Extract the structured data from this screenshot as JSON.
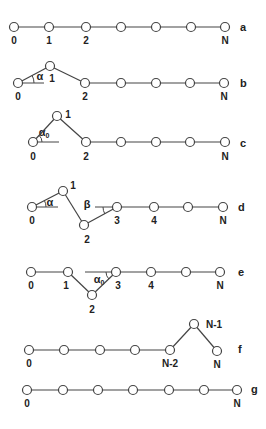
{
  "diagram": {
    "colors": {
      "line": "#444444",
      "node_fill": "#ffffff",
      "node_stroke": "#444444",
      "text": "#222222"
    },
    "node_radius": 4.5,
    "rows": [
      {
        "id": "a",
        "label": "a",
        "label_pos": [
          240,
          31
        ],
        "nodes": [
          [
            14,
            27
          ],
          [
            49,
            27
          ],
          [
            86,
            27
          ],
          [
            121,
            27
          ],
          [
            156,
            27
          ],
          [
            191,
            27
          ],
          [
            225,
            27
          ]
        ],
        "node_labels": [
          {
            "text": "0",
            "pos": [
              14,
              44
            ]
          },
          {
            "text": "1",
            "pos": [
              49,
              44
            ]
          },
          {
            "text": "2",
            "pos": [
              86,
              44
            ]
          },
          {
            "text": "N",
            "pos": [
              225,
              44
            ]
          }
        ],
        "angles": []
      },
      {
        "id": "b",
        "label": "b",
        "label_pos": [
          240,
          87
        ],
        "nodes": [
          [
            18,
            83
          ],
          [
            50,
            66
          ],
          [
            85,
            83
          ],
          [
            121,
            83
          ],
          [
            156,
            83
          ],
          [
            190,
            83
          ],
          [
            224,
            83
          ]
        ],
        "node_labels": [
          {
            "text": "0",
            "pos": [
              18,
              100
            ]
          },
          {
            "text": "1",
            "pos": [
              52,
              82
            ]
          },
          {
            "text": "2",
            "pos": [
              85,
              100
            ]
          },
          {
            "text": "N",
            "pos": [
              224,
              100
            ]
          }
        ],
        "angles": [
          {
            "symbol": "α",
            "pos": [
              40,
              80
            ],
            "arc": {
              "cx": 18,
              "cy": 83,
              "r": 16,
              "from": 0,
              "to": -28
            },
            "ref_line": [
              [
                18,
                83
              ],
              [
                44,
                83
              ]
            ]
          }
        ]
      },
      {
        "id": "c",
        "label": "c",
        "label_pos": [
          240,
          147
        ],
        "nodes": [
          [
            33,
            142
          ],
          [
            57,
            116
          ],
          [
            86,
            142
          ],
          [
            121,
            142
          ],
          [
            156,
            142
          ],
          [
            190,
            142
          ],
          [
            225,
            142
          ]
        ],
        "node_labels": [
          {
            "text": "0",
            "pos": [
              33,
              160
            ]
          },
          {
            "text": "1",
            "pos": [
              68,
              118
            ]
          },
          {
            "text": "2",
            "pos": [
              86,
              160
            ]
          },
          {
            "text": "N",
            "pos": [
              225,
              160
            ]
          }
        ],
        "angles": [
          {
            "symbol": "α",
            "sub": "0",
            "pos": [
              44,
              136
            ],
            "arc": {
              "cx": 33,
              "cy": 142,
              "r": 9,
              "from": 0,
              "to": -47
            },
            "ref_line": [
              [
                33,
                142
              ],
              [
                59,
                142
              ]
            ]
          }
        ]
      },
      {
        "id": "d",
        "label": "d",
        "label_pos": [
          238,
          211
        ],
        "nodes": [
          [
            32,
            207
          ],
          [
            63,
            191
          ],
          [
            84,
            225
          ],
          [
            117,
            207
          ],
          [
            154,
            207
          ],
          [
            188,
            207
          ],
          [
            223,
            207
          ]
        ],
        "node_labels": [
          {
            "text": "0",
            "pos": [
              32,
              224
            ]
          },
          {
            "text": "1",
            "pos": [
              73,
              189
            ]
          },
          {
            "text": "2",
            "pos": [
              87,
              243
            ]
          },
          {
            "text": "3",
            "pos": [
              117,
              224
            ]
          },
          {
            "text": "4",
            "pos": [
              154,
              224
            ]
          },
          {
            "text": "N",
            "pos": [
              223,
              224
            ]
          }
        ],
        "angles": [
          {
            "symbol": "α",
            "pos": [
              50,
              206
            ],
            "arc": {
              "cx": 32,
              "cy": 207,
              "r": 14,
              "from": 0,
              "to": -27
            },
            "ref_line": [
              [
                32,
                207
              ],
              [
                58,
                207
              ]
            ]
          },
          {
            "symbol": "β",
            "pos": [
              87,
              208
            ],
            "arc": {
              "cx": 117,
              "cy": 207,
              "r": 14,
              "from": 180,
              "to": 150
            },
            "ref_line": [
              [
                95,
                207
              ],
              [
                117,
                207
              ]
            ]
          }
        ]
      },
      {
        "id": "e",
        "label": "e",
        "label_pos": [
          238,
          276
        ],
        "nodes": [
          [
            31,
            272
          ],
          [
            68,
            272
          ],
          [
            92,
            295
          ],
          [
            116,
            272
          ],
          [
            151,
            272
          ],
          [
            186,
            272
          ],
          [
            220,
            272
          ]
        ],
        "node_labels": [
          {
            "text": "0",
            "pos": [
              31,
              289
            ]
          },
          {
            "text": "1",
            "pos": [
              66,
              289
            ]
          },
          {
            "text": "2",
            "pos": [
              92,
              313
            ]
          },
          {
            "text": "3",
            "pos": [
              118,
              289
            ]
          },
          {
            "text": "4",
            "pos": [
              151,
              289
            ]
          },
          {
            "text": "N",
            "pos": [
              220,
              289
            ]
          }
        ],
        "angles": [
          {
            "symbol": "α",
            "sub": "0",
            "pos": [
              99,
              283
            ],
            "arc": {
              "cx": 116,
              "cy": 272,
              "r": 10,
              "from": 180,
              "to": 136
            },
            "ref_line": [
              [
                85,
                272
              ],
              [
                116,
                272
              ]
            ]
          }
        ]
      },
      {
        "id": "f",
        "label": "f",
        "label_pos": [
          238,
          353
        ],
        "nodes": [
          [
            29,
            350
          ],
          [
            64,
            350
          ],
          [
            100,
            350
          ],
          [
            135,
            350
          ],
          [
            170,
            350
          ],
          [
            194,
            324
          ],
          [
            217,
            351
          ]
        ],
        "node_labels": [
          {
            "text": "0",
            "pos": [
              29,
              367
            ]
          },
          {
            "text": "N-2",
            "pos": [
              170,
              367
            ]
          },
          {
            "text": "N-1",
            "pos": [
              214,
              328
            ]
          },
          {
            "text": "N",
            "pos": [
              217,
              368
            ]
          }
        ],
        "angles": []
      },
      {
        "id": "g",
        "label": "g",
        "label_pos": [
          251,
          393
        ],
        "nodes": [
          [
            27,
            390
          ],
          [
            63,
            390
          ],
          [
            98,
            390
          ],
          [
            133,
            390
          ],
          [
            169,
            390
          ],
          [
            204,
            390
          ],
          [
            237,
            390
          ]
        ],
        "node_labels": [
          {
            "text": "0",
            "pos": [
              27,
              407
            ]
          },
          {
            "text": "N",
            "pos": [
              237,
              407
            ]
          }
        ],
        "angles": []
      }
    ]
  }
}
